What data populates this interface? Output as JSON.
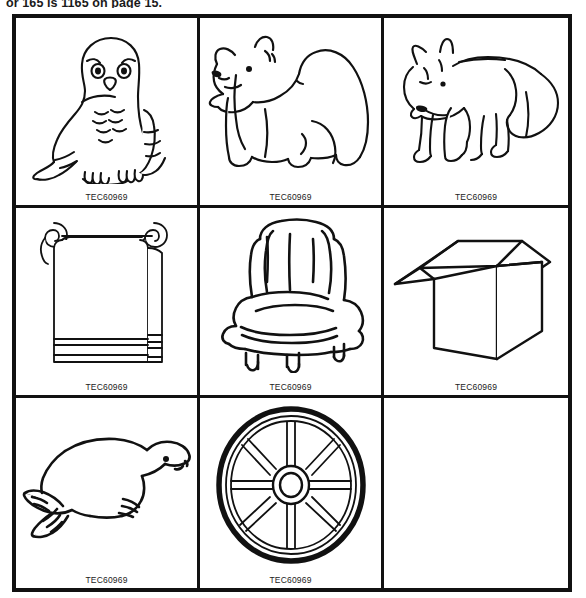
{
  "header": {
    "text": "or 165 is 1165  on page 15."
  },
  "sheet": {
    "caption_common": "TEC60969",
    "ink_color": "#111111",
    "background_color": "#ffffff",
    "rows": 3,
    "columns": 3,
    "cells": [
      {
        "position": "row1-col1",
        "subject": "snowy-owl",
        "caption": "TEC60969",
        "empty": false
      },
      {
        "position": "row1-col2",
        "subject": "polar-bear",
        "caption": "TEC60969",
        "empty": false
      },
      {
        "position": "row1-col3",
        "subject": "arctic-fox",
        "caption": "TEC60969",
        "empty": false
      },
      {
        "position": "row2-col1",
        "subject": "towel-on-rack",
        "caption": "TEC60969",
        "empty": false
      },
      {
        "position": "row2-col2",
        "subject": "armchair",
        "caption": "TEC60969",
        "empty": false
      },
      {
        "position": "row2-col3",
        "subject": "open-box",
        "caption": "TEC60969",
        "empty": false
      },
      {
        "position": "row3-col1",
        "subject": "seal",
        "caption": "TEC60969",
        "empty": false
      },
      {
        "position": "row3-col2",
        "subject": "wagon-wheel",
        "caption": "TEC60969",
        "empty": false
      },
      {
        "position": "row3-col3",
        "subject": "blank",
        "caption": "",
        "empty": true
      }
    ]
  }
}
